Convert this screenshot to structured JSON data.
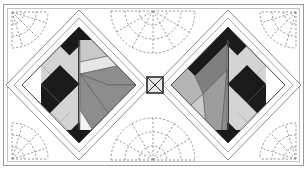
{
  "figure": {
    "width": 307,
    "height": 170
  },
  "colors": {
    "background": "#ffffff",
    "border": "#8e8e8e",
    "outline": "#4a4a4a",
    "thin_line": "#9a9a9a",
    "black": "#1a1a1a",
    "dark": "#262626",
    "light_gray": "#d4d4d4",
    "pale_gray": "#e3e3e3",
    "mid_gray": "#8d8d8d",
    "medium_gray": "#a5a5a5",
    "deep_gray": "#6f6f6f",
    "white_patch": "#fafafa",
    "quilting_dash": "#8a8a8a"
  },
  "frame": {
    "outer_rect": {
      "x": 3,
      "y": 4,
      "width": 301,
      "height": 162
    },
    "inner_rect": {
      "x": 7,
      "y": 8,
      "width": 293,
      "height": 154
    },
    "stroke_width": 1
  },
  "blocks": [
    {
      "name": "left-diamond-block",
      "center": {
        "x": 79,
        "y": 85
      },
      "radius": 74,
      "sashing_radius": 60,
      "orientation": "checkerboard-left",
      "checkerboard": {
        "rows": 4,
        "cols": 4,
        "colors": [
          "#1a1a1a",
          "#d4d4d4"
        ]
      },
      "pieced_shapes": 7
    },
    {
      "name": "right-diamond-block",
      "center": {
        "x": 228,
        "y": 85
      },
      "radius": 74,
      "sashing_radius": 60,
      "orientation": "checkerboard-right",
      "checkerboard": {
        "rows": 4,
        "cols": 4,
        "colors": [
          "#1a1a1a",
          "#d4d4d4"
        ]
      },
      "pieced_shapes": 8
    }
  ],
  "center_square": {
    "name": "center-x-square",
    "x": 147,
    "y": 77,
    "size": 16,
    "fill": "#e3e3e3",
    "cross": true
  },
  "quilting_motifs": [
    {
      "name": "fan-top-left-corner",
      "cx": 12,
      "cy": 12,
      "radius": 40,
      "start_angle": 0,
      "end_angle": 90,
      "rays": 5
    },
    {
      "name": "fan-top-center",
      "cx": 153,
      "cy": 11,
      "radius": 44,
      "start_angle": 0,
      "end_angle": 180,
      "rays": 6
    },
    {
      "name": "fan-top-right-corner",
      "cx": 296,
      "cy": 12,
      "radius": 40,
      "start_angle": 90,
      "end_angle": 180,
      "rays": 5
    },
    {
      "name": "fan-bottom-left-corner",
      "cx": 12,
      "cy": 159,
      "radius": 40,
      "start_angle": 270,
      "end_angle": 360,
      "rays": 5
    },
    {
      "name": "fan-bottom-center",
      "cx": 153,
      "cy": 160,
      "radius": 44,
      "start_angle": 180,
      "end_angle": 360,
      "rays": 6
    },
    {
      "name": "fan-bottom-right-corner",
      "cx": 296,
      "cy": 159,
      "radius": 40,
      "start_angle": 180,
      "end_angle": 270,
      "rays": 5
    }
  ]
}
